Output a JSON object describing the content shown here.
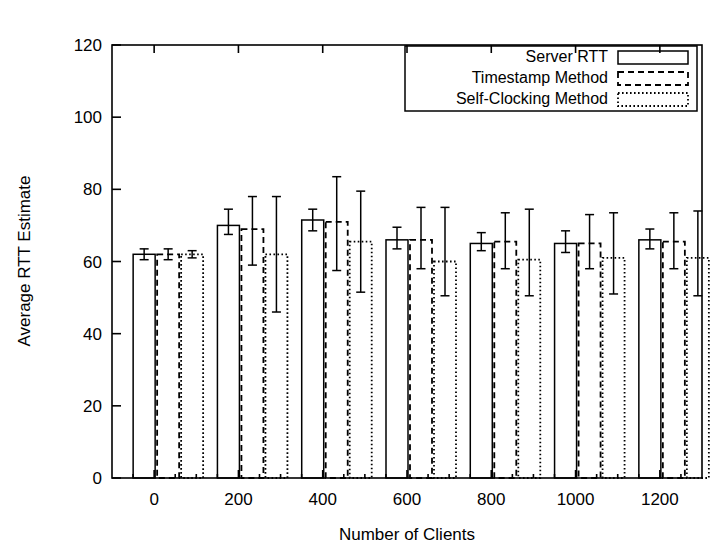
{
  "chart_data": {
    "type": "bar",
    "title": "",
    "xlabel": "Number of Clients",
    "ylabel": "Average RTT Estimate",
    "categories": [
      "0",
      "200",
      "400",
      "600",
      "800",
      "1000",
      "1200"
    ],
    "xlim": [
      -100,
      1300
    ],
    "ylim": [
      0,
      120
    ],
    "yticks": [
      0,
      20,
      40,
      60,
      80,
      100,
      120
    ],
    "xticks": [
      0,
      200,
      400,
      600,
      800,
      1000,
      1200
    ],
    "grid": false,
    "legend_position": "top-right",
    "series": [
      {
        "name": "Server RTT",
        "style": "solid",
        "values": [
          62,
          70,
          71.5,
          66,
          65,
          65,
          66
        ],
        "err_low": [
          60.5,
          67.5,
          68.5,
          63.5,
          63,
          62.5,
          63.5
        ],
        "err_high": [
          63.5,
          74.5,
          74.5,
          69.5,
          68,
          68.5,
          69
        ]
      },
      {
        "name": "Timestamp Method",
        "style": "dashed",
        "values": [
          62,
          69,
          71,
          66,
          65.5,
          65,
          65.5
        ],
        "err_low": [
          60.5,
          59,
          57.5,
          58,
          58,
          58,
          58
        ],
        "err_high": [
          63.5,
          78,
          83.5,
          75,
          73.5,
          73,
          73.5
        ]
      },
      {
        "name": "Self-Clocking Method",
        "style": "dotted",
        "values": [
          62,
          62,
          65.5,
          60,
          60.5,
          61,
          61
        ],
        "err_low": [
          61,
          46,
          51.5,
          50.5,
          50.5,
          51,
          50.5
        ],
        "err_high": [
          63,
          78,
          79.5,
          75,
          74.5,
          73.5,
          74
        ]
      }
    ]
  },
  "legend": {
    "entries": [
      {
        "label": "Server RTT",
        "style": "solid"
      },
      {
        "label": "Timestamp Method",
        "style": "dashed"
      },
      {
        "label": "Self-Clocking Method",
        "style": "dotted"
      }
    ]
  },
  "axes": {
    "y_tick_labels": [
      "0",
      "20",
      "40",
      "60",
      "80",
      "100",
      "120"
    ],
    "x_tick_labels": [
      "0",
      "200",
      "400",
      "600",
      "800",
      "1000",
      "1200"
    ],
    "y_axis_title": "Average RTT Estimate",
    "x_axis_title": "Number of Clients"
  }
}
